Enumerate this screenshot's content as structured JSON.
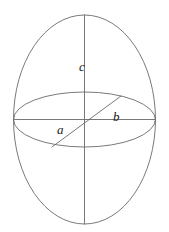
{
  "figure": {
    "name": "triaxial-ellipsoid-axes-diagram",
    "background_color": "#ffffff",
    "stroke_color": "#6a6a6a",
    "stroke_width": 0.9,
    "label_color": "#1a1a1a",
    "width": 169,
    "height": 232
  },
  "labels": {
    "a": "a",
    "b": "b",
    "c": "c"
  },
  "geometry": {
    "outer_ellipse": {
      "name": "outer-ellipse",
      "cx": 84.5,
      "cy": 119.5,
      "rx": 71,
      "ry": 104.5
    },
    "equator_ellipse": {
      "name": "equator-ellipse",
      "cx": 84.5,
      "cy": 119.5,
      "rx": 71,
      "ry": 27.5
    },
    "vertical_axis": {
      "name": "vertical-axis-line",
      "x1": 84.5,
      "y1": 15,
      "x2": 84.5,
      "y2": 224
    },
    "horizontal_axis": {
      "name": "horizontal-axis-line",
      "x1": 13.5,
      "y1": 119.5,
      "x2": 155.5,
      "y2": 119.5
    },
    "diagonal_axis": {
      "name": "diagonal-axis-line",
      "x1": 52,
      "y1": 147,
      "x2": 121,
      "y2": 96
    }
  },
  "chart_data": {
    "type": "diagram",
    "title": "",
    "elements": [
      {
        "id": "outer-ellipse",
        "role": "ellipsoid-silhouette",
        "shape": "ellipse"
      },
      {
        "id": "equator-ellipse",
        "role": "equatorial-cross-section",
        "shape": "ellipse"
      },
      {
        "id": "axis-c",
        "role": "vertical-semi-axis",
        "label": "c",
        "direction": "up"
      },
      {
        "id": "axis-b",
        "role": "horizontal-semi-axis",
        "label": "b",
        "direction": "right"
      },
      {
        "id": "axis-a",
        "role": "oblique-semi-axis",
        "label": "a",
        "direction": "lower-left"
      }
    ]
  }
}
